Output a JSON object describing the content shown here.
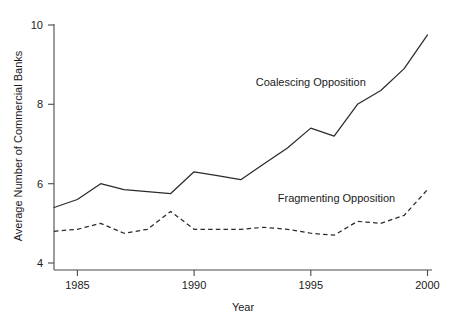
{
  "chart_data": {
    "type": "line",
    "title": "",
    "xlabel": "Year",
    "ylabel": "Average Number of Commercial Banks",
    "xlim": [
      1983.5,
      2000.5
    ],
    "ylim": [
      4,
      10
    ],
    "xticks": [
      1985,
      1990,
      1995,
      2000
    ],
    "yticks": [
      4,
      6,
      8,
      10
    ],
    "grid": false,
    "legend_position": "inline-annotation",
    "x": [
      1984,
      1985,
      1986,
      1987,
      1988,
      1989,
      1990,
      1991,
      1992,
      1993,
      1994,
      1995,
      1996,
      1997,
      1998,
      1999,
      2000
    ],
    "series": [
      {
        "name": "Coalescing Opposition",
        "style": "solid",
        "color": "#2b2b2b",
        "values": [
          5.4,
          5.6,
          6.0,
          5.85,
          5.8,
          5.75,
          6.3,
          6.2,
          6.1,
          6.5,
          6.9,
          7.4,
          7.2,
          8.0,
          8.35,
          8.9,
          9.75
        ]
      },
      {
        "name": "Fragmenting Opposition",
        "style": "dashed",
        "color": "#2b2b2b",
        "values": [
          4.8,
          4.85,
          5.0,
          4.75,
          4.85,
          5.3,
          4.85,
          4.85,
          4.85,
          4.9,
          4.85,
          4.75,
          4.7,
          5.05,
          5.0,
          5.2,
          5.85
        ]
      }
    ],
    "annotations": [
      {
        "text": "Coalescing Opposition",
        "x": 1995.0,
        "y": 8.45
      },
      {
        "text": "Fragmenting Opposition",
        "x": 1996.1,
        "y": 5.55
      }
    ]
  },
  "axis": {
    "x_title": "Year",
    "y_title": "Average Number of Commercial Banks",
    "xtick_labels": [
      "1985",
      "1990",
      "1995",
      "2000"
    ],
    "ytick_labels": [
      "4",
      "6",
      "8",
      "10"
    ]
  },
  "labels": {
    "coalescing": "Coalescing Opposition",
    "fragmenting": "Fragmenting Opposition"
  }
}
